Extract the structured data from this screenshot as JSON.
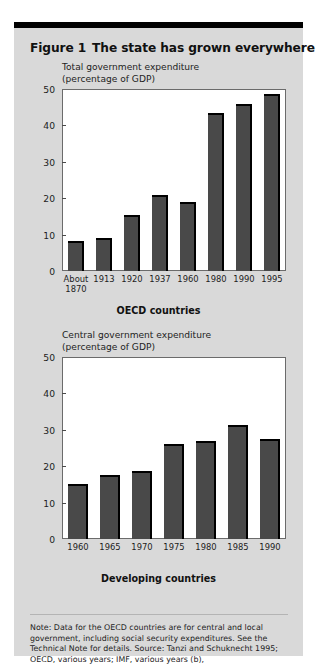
{
  "figure": {
    "number_label": "Figure 1",
    "title": "The state has grown everywhere",
    "note": "Note: Data for the OECD countries are for central and local government, including social security expenditures. See the Technical Note for details. Source: Tanzi and Schuknecht 1995; OECD, various years; IMF, various years (b),"
  },
  "colors": {
    "card_background": "#d9d9d9",
    "bar_fill": "#494949",
    "bar_edge": "#000000",
    "plot_background": "#ffffff",
    "plot_border": "#6b6b6b",
    "top_bar": "#000000"
  },
  "chart_data": [
    {
      "type": "bar",
      "id": "oecd",
      "title": "Total government expenditure\n(percentage of GDP)",
      "title_line1": "Total government expenditure",
      "title_line2": "(percentage of GDP)",
      "group_label": "OECD countries",
      "xlabel": "",
      "ylabel": "percentage of GDP",
      "ylim": [
        0,
        50
      ],
      "yticks": [
        0,
        10,
        20,
        30,
        40,
        50
      ],
      "ytick_labels": [
        "0",
        "10",
        "20",
        "30",
        "40",
        "50"
      ],
      "grid": false,
      "legend": "none",
      "categories": [
        "About\n1870",
        "1913",
        "1920",
        "1937",
        "1960",
        "1980",
        "1990",
        "1995"
      ],
      "category_labels": [
        "About 1870",
        "1913",
        "1920",
        "1937",
        "1960",
        "1980",
        "1990",
        "1995"
      ],
      "values": [
        8.3,
        9.2,
        15.5,
        21.0,
        19.0,
        43.5,
        46.0,
        48.5
      ]
    },
    {
      "type": "bar",
      "id": "developing",
      "title": "Central government expenditure\n(percentage of GDP)",
      "title_line1": "Central government expenditure",
      "title_line2": "(percentage of GDP)",
      "group_label": "Developing countries",
      "xlabel": "",
      "ylabel": "percentage of GDP",
      "ylim": [
        0,
        50
      ],
      "yticks": [
        0,
        10,
        20,
        30,
        40,
        50
      ],
      "ytick_labels": [
        "0",
        "10",
        "20",
        "30",
        "40",
        "50"
      ],
      "grid": false,
      "legend": "none",
      "categories": [
        "1960",
        "1965",
        "1970",
        "1975",
        "1980",
        "1985",
        "1990"
      ],
      "category_labels": [
        "1960",
        "1965",
        "1970",
        "1975",
        "1980",
        "1985",
        "1990"
      ],
      "values": [
        15.0,
        17.5,
        18.7,
        26.0,
        27.0,
        31.3,
        27.5
      ]
    }
  ]
}
